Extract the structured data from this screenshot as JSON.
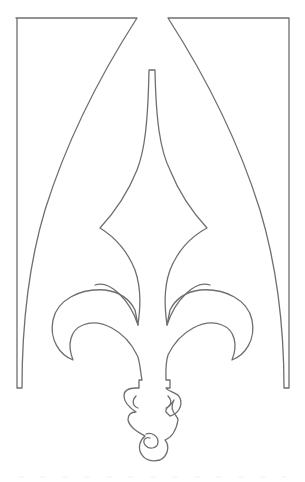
{
  "illustration": {
    "subject": "gothic arch panel with fleur-de-lis ornament",
    "stroke_color": "#6f6f6f",
    "background_color": "#ffffff",
    "stroke_width": 1.3
  }
}
